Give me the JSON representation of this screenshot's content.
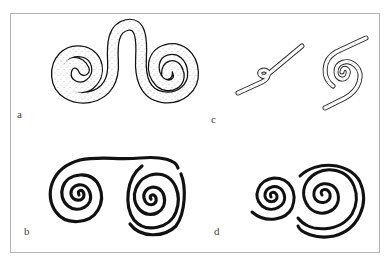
{
  "figure": {
    "panels": [
      {
        "id": "a",
        "label": "a",
        "description": "Stippled double spiral joined by an upward loop (cord-like, dotted fill)"
      },
      {
        "id": "b",
        "label": "b",
        "description": "Two solid black spirals joined by a top connecting line"
      },
      {
        "id": "c",
        "label": "c",
        "description": "Cord with a small S-twist and a cord coiled into a spiral"
      },
      {
        "id": "d",
        "label": "d",
        "description": "Two solid black adjoining spirals, small left and large right"
      }
    ],
    "colors": {
      "ink": "#111111",
      "frame": "#b4b4b4",
      "stipple": "#8a8a8a",
      "background": "#ffffff"
    }
  }
}
